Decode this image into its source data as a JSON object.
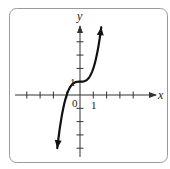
{
  "chart_data": {
    "type": "line",
    "title": "",
    "function": "y = x^3 + 1",
    "xlabel": "x",
    "ylabel": "y",
    "origin_label": "0",
    "x_tick_label": "1",
    "y_tick_label": "1",
    "xlim": [
      -4,
      5
    ],
    "ylim": [
      -4.5,
      5.1
    ],
    "x_ticks": [
      -4,
      -3,
      -2,
      -1,
      1,
      2,
      3,
      4
    ],
    "y_ticks": [
      -4,
      -3,
      -2,
      -1,
      1,
      2,
      3,
      4
    ],
    "grid": false,
    "legend": null,
    "series": [
      {
        "name": "curve",
        "x": [
          -1.71,
          -1.5,
          -1.25,
          -1.0,
          -0.75,
          -0.5,
          -0.25,
          0,
          0.25,
          0.5,
          0.75,
          1.0,
          1.25,
          1.5,
          1.6
        ],
        "y": [
          -4.0,
          -2.38,
          -0.95,
          0.0,
          0.58,
          0.88,
          0.98,
          1.0,
          1.02,
          1.13,
          1.42,
          2.0,
          2.95,
          4.38,
          5.1
        ]
      }
    ],
    "curve_end_arrows": true,
    "axis_arrows": [
      "x-positive",
      "y-positive"
    ]
  },
  "colors": {
    "frame": "#9a9a9a",
    "axis": "#333333",
    "curve": "#111111",
    "background": "#ffffff"
  }
}
